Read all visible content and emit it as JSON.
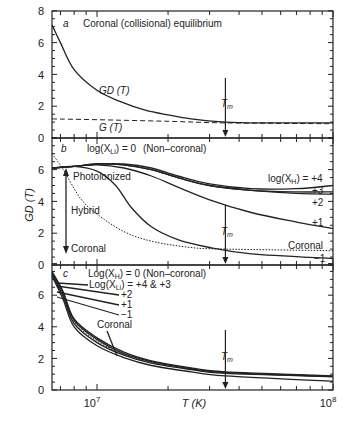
{
  "chart_data": [
    {
      "panel": "a",
      "type": "line",
      "title": "Coronal (collisional) equilibrium",
      "xlabel": "T (K)",
      "ylabel": "GD(T)",
      "xscale": "log",
      "xlim": [
        6450000,
        100000000
      ],
      "ylim": [
        0,
        8
      ],
      "yticks": [
        0,
        2,
        4,
        6,
        8
      ],
      "series": [
        {
          "name": "GD (T)",
          "style": "solid",
          "x": [
            6450000,
            7000000,
            8000000,
            10000000,
            12500000,
            16000000,
            20000000,
            25000000,
            35000000,
            50000000,
            100000000
          ],
          "values": [
            7.1,
            6.0,
            4.3,
            3.0,
            2.3,
            1.75,
            1.45,
            1.2,
            1.0,
            0.95,
            0.95
          ]
        },
        {
          "name": "G (T)",
          "style": "dashed",
          "x": [
            6450000,
            10000000,
            20000000,
            35000000,
            100000000
          ],
          "values": [
            1.2,
            1.15,
            1.05,
            0.95,
            0.9
          ]
        }
      ],
      "annotations": [
        {
          "text": "T_m",
          "x": 35000000,
          "arrow": "down"
        }
      ]
    },
    {
      "panel": "b",
      "type": "line",
      "title": "log(X_Li) = 0  (Non-coronal)",
      "xlabel": "T (K)",
      "ylabel": "GD(T)",
      "xscale": "log",
      "xlim": [
        6450000,
        100000000
      ],
      "ylim": [
        0,
        8
      ],
      "yticks": [
        0,
        2,
        4,
        6
      ],
      "series": [
        {
          "name": "log(X_H) = +4",
          "style": "solid",
          "x": [
            6450000,
            8000000,
            10000000,
            13000000,
            17000000,
            22000000,
            30000000,
            45000000,
            70000000,
            100000000
          ],
          "values": [
            6.1,
            6.2,
            6.35,
            6.35,
            6.1,
            5.6,
            5.1,
            4.8,
            4.8,
            5.0
          ]
        },
        {
          "name": "+3",
          "style": "solid",
          "x": [
            6450000,
            8000000,
            10000000,
            13000000,
            17000000,
            22000000,
            30000000,
            45000000,
            70000000,
            100000000
          ],
          "values": [
            6.1,
            6.2,
            6.35,
            6.3,
            6.0,
            5.5,
            5.0,
            4.7,
            4.6,
            4.6
          ]
        },
        {
          "name": "+2",
          "style": "solid",
          "x": [
            6450000,
            8000000,
            10000000,
            13000000,
            17000000,
            22000000,
            30000000,
            45000000,
            70000000,
            100000000
          ],
          "values": [
            6.1,
            6.2,
            6.35,
            6.3,
            6.0,
            5.5,
            5.0,
            4.7,
            4.5,
            4.45
          ]
        },
        {
          "name": "+1",
          "style": "solid",
          "x": [
            6450000,
            8000000,
            10000000,
            13000000,
            17000000,
            22000000,
            30000000,
            45000000,
            70000000,
            100000000
          ],
          "values": [
            6.1,
            6.2,
            6.3,
            6.1,
            5.6,
            4.9,
            4.1,
            3.3,
            2.7,
            2.3
          ]
        },
        {
          "name": "-1",
          "style": "solid",
          "x": [
            6450000,
            8000000,
            10000000,
            12000000,
            14000000,
            17000000,
            22000000,
            30000000,
            45000000,
            100000000
          ],
          "values": [
            6.1,
            6.2,
            5.9,
            5.0,
            3.6,
            2.4,
            1.6,
            1.1,
            0.7,
            0.4
          ]
        },
        {
          "name": "Coronal",
          "style": "dotted",
          "x": [
            6450000,
            7200000,
            8500000,
            10000000,
            13000000,
            17000000,
            25000000,
            35000000,
            100000000
          ],
          "values": [
            7.0,
            6.0,
            4.2,
            3.2,
            2.1,
            1.5,
            1.1,
            1.0,
            0.9
          ]
        }
      ],
      "annotations": [
        {
          "text": "Photoionized"
        },
        {
          "text": "Hybrid"
        },
        {
          "text": "Coronal"
        },
        {
          "text": "log(X_H) = +4"
        },
        {
          "text": "+3"
        },
        {
          "text": "+2"
        },
        {
          "text": "+1"
        },
        {
          "text": "-1"
        },
        {
          "text": "Coronal"
        },
        {
          "text": "T_m",
          "x": 35000000,
          "arrow": "down"
        }
      ]
    },
    {
      "panel": "c",
      "type": "line",
      "title": "Log(X_H) = 0  (Non-coronal)",
      "xlabel": "T (K)",
      "ylabel": "GD(T)",
      "xscale": "log",
      "xlim": [
        6450000,
        100000000
      ],
      "xticklabels": [
        "10^7",
        "10^8"
      ],
      "ylim": [
        0,
        8
      ],
      "yticks": [
        0,
        2,
        4,
        6
      ],
      "series": [
        {
          "name": "Log(X_Li) = +4 & +3",
          "style": "solid",
          "x": [
            6450000,
            7200000,
            8000000,
            10000000,
            13000000,
            17000000,
            25000000,
            35000000,
            100000000
          ],
          "values": [
            7.5,
            6.2,
            4.5,
            3.3,
            2.4,
            1.85,
            1.4,
            1.15,
            0.9
          ]
        },
        {
          "name": "+2",
          "style": "solid",
          "x": [
            6450000,
            7200000,
            8000000,
            10000000,
            13000000,
            17000000,
            25000000,
            35000000,
            100000000
          ],
          "values": [
            7.4,
            6.1,
            4.4,
            3.2,
            2.3,
            1.8,
            1.35,
            1.1,
            0.85
          ]
        },
        {
          "name": "+1",
          "style": "solid",
          "x": [
            6450000,
            7200000,
            8000000,
            10000000,
            13000000,
            17000000,
            25000000,
            35000000,
            100000000
          ],
          "values": [
            7.3,
            5.9,
            4.2,
            3.0,
            2.2,
            1.7,
            1.3,
            1.05,
            0.85
          ]
        },
        {
          "name": "-1",
          "style": "solid",
          "x": [
            6450000,
            7200000,
            8000000,
            10000000,
            13000000,
            17000000,
            25000000,
            35000000,
            100000000
          ],
          "values": [
            7.2,
            5.7,
            4.0,
            2.8,
            2.05,
            1.55,
            1.15,
            0.9,
            0.55
          ]
        },
        {
          "name": "Coronal",
          "style": "dotted",
          "x": [
            6450000,
            7200000,
            8000000,
            10000000,
            13000000,
            17000000,
            25000000,
            35000000,
            100000000
          ],
          "values": [
            7.35,
            6.0,
            4.3,
            3.1,
            2.25,
            1.75,
            1.35,
            1.1,
            0.9
          ]
        }
      ],
      "annotations": [
        {
          "text": "Log(X_H) = 0  (Non-coronal)"
        },
        {
          "text": "Log(X_Li) = +4 & +3"
        },
        {
          "text": "+2"
        },
        {
          "text": "+1"
        },
        {
          "text": "-1"
        },
        {
          "text": "Coronal"
        },
        {
          "text": "T_m",
          "x": 35000000,
          "arrow": "down"
        }
      ]
    }
  ],
  "labels": {
    "panel_a_letter": "a",
    "panel_a_title": "Coronal (collisional) equilibrium",
    "panel_a_gd": "GD (T)",
    "panel_a_g": "G (T)",
    "panel_b_letter": "b",
    "panel_b_title_pre": "log(X",
    "panel_b_title_sub": "Li",
    "panel_b_title_post": ") = 0",
    "panel_b_noncoronal": "(Non–coronal)",
    "photoionized": "Photoionized",
    "hybrid": "Hybrid",
    "coronal_left": "Coronal",
    "xh_pre": "log(X",
    "xh_sub": "H",
    "xh_post": ") = +4",
    "p3": "+3",
    "p2": "+2",
    "p1": "+1",
    "m1": "−1",
    "coronal_right": "Coronal",
    "panel_c_letter": "c",
    "panel_c_title_pre": "Log(X",
    "panel_c_title_sub": "H",
    "panel_c_title_post": ") = 0  (Non–coronal)",
    "panel_c_li_pre": "Log(X",
    "panel_c_li_sub": "Li",
    "panel_c_li_post": ") = +4 & +3",
    "c_p2": "+2",
    "c_p1": "+1",
    "c_m1": "−1",
    "c_coronal": "Coronal",
    "tm_main": "T",
    "tm_sub": "m",
    "ylabel": "GD (T)",
    "xlabel": "T (K)",
    "x_tick_7_base": "10",
    "x_tick_7_exp": "7",
    "x_tick_8_base": "10",
    "x_tick_8_exp": "8",
    "y_ticks_a": [
      "0",
      "2",
      "4",
      "6",
      "8"
    ],
    "y_ticks_b": [
      "0",
      "2",
      "4",
      "6"
    ],
    "y_ticks_c": [
      "0",
      "2",
      "4",
      "6"
    ]
  }
}
